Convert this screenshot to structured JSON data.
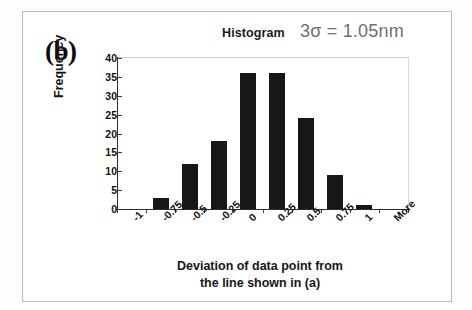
{
  "figure": {
    "panel_label": "(b)",
    "title": "Histogram",
    "sigma_note": "3σ = 1.05nm",
    "border_color": "#b9b9b9",
    "bar_color": "#171717",
    "note_color": "#6e6e6e",
    "x_axis_title_line1": "Deviation of data point from",
    "x_axis_title_line2": "the line shown in (a)"
  },
  "chart_data": {
    "type": "bar",
    "title": "Histogram",
    "annotations": [
      "3σ = 1.05nm",
      "(b)"
    ],
    "categories": [
      "-1",
      "-0.75",
      "-0.5",
      "-0.25",
      "0",
      "0.25",
      "0.5",
      "0.75",
      "1",
      "More"
    ],
    "values": [
      0,
      3,
      12,
      18,
      36,
      36,
      24,
      9,
      1,
      0
    ],
    "xlabel": "Deviation of data point from the line shown in (a)",
    "ylabel": "Frequency",
    "ylim": [
      0,
      40
    ],
    "ytick_values": [
      40,
      35,
      30,
      25,
      20,
      15,
      10,
      5,
      0
    ],
    "ytick_labels": [
      "40",
      "35",
      "30",
      "25",
      "20",
      "15",
      "10",
      "5",
      "0"
    ],
    "grid": false,
    "legend": null,
    "xtick_rotation_deg": -45
  }
}
